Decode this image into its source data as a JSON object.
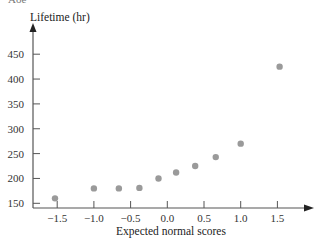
{
  "top_fragment": "Aoe",
  "chart_data": {
    "type": "scatter",
    "title": "",
    "xlabel": "Expected normal scores",
    "ylabel": "Lifetime (hr)",
    "xlim": [
      -1.85,
      1.95
    ],
    "ylim": [
      140,
      500
    ],
    "x_ticks": [
      -1.5,
      -1.0,
      -0.5,
      0.0,
      0.5,
      1.0,
      1.5
    ],
    "x_tick_labels": [
      "−1.5",
      "−1.0",
      "−0.5",
      "0.0",
      "0.5",
      "1.0",
      "1.5"
    ],
    "y_ticks": [
      150,
      200,
      250,
      300,
      350,
      400,
      450
    ],
    "y_tick_labels": [
      "150",
      "200",
      "250",
      "300",
      "350",
      "400",
      "450"
    ],
    "grid": false,
    "legend": null,
    "marker_color": "#9a9a9a",
    "series": [
      {
        "name": "Lifetime vs expected normal score",
        "x": [
          -1.53,
          -1.0,
          -0.66,
          -0.38,
          -0.12,
          0.12,
          0.38,
          0.66,
          1.0,
          1.53
        ],
        "y": [
          160,
          180,
          180,
          181,
          200,
          212,
          225,
          243,
          270,
          425
        ]
      }
    ]
  }
}
